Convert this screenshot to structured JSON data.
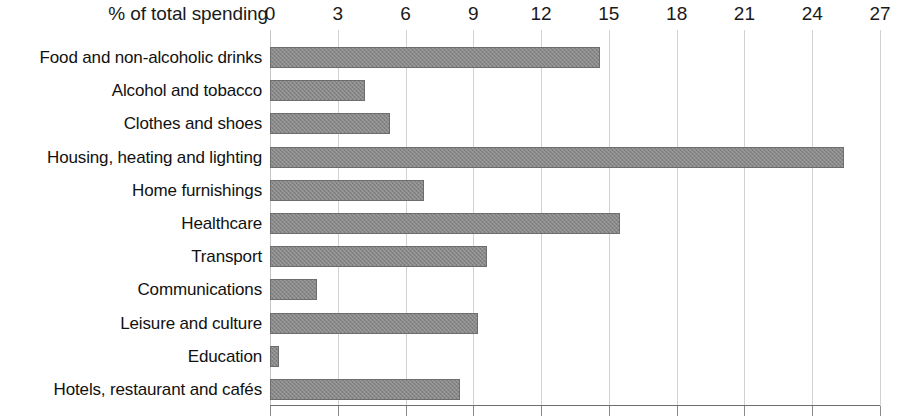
{
  "chart_data": {
    "type": "bar",
    "orientation": "horizontal",
    "title": "",
    "xlabel": "% of total spending",
    "ylabel": "",
    "xlim": [
      0,
      27
    ],
    "xticks": [
      0,
      3,
      6,
      9,
      12,
      15,
      18,
      21,
      24,
      27
    ],
    "grid": true,
    "legend": false,
    "bar_color": "#888888",
    "bar_edge_color": "#6d6d6d",
    "gridline_color": "#d2d2d2",
    "categories": [
      "Food and non-alcoholic drinks",
      "Alcohol and tobacco",
      "Clothes and shoes",
      "Housing, heating and lighting",
      "Home furnishings",
      "Healthcare",
      "Transport",
      "Communications",
      "Leisure and culture",
      "Education",
      "Hotels, restaurant and cafés"
    ],
    "values": [
      14.6,
      4.2,
      5.3,
      25.4,
      6.8,
      15.5,
      9.6,
      2.1,
      9.2,
      0.4,
      8.4
    ]
  }
}
